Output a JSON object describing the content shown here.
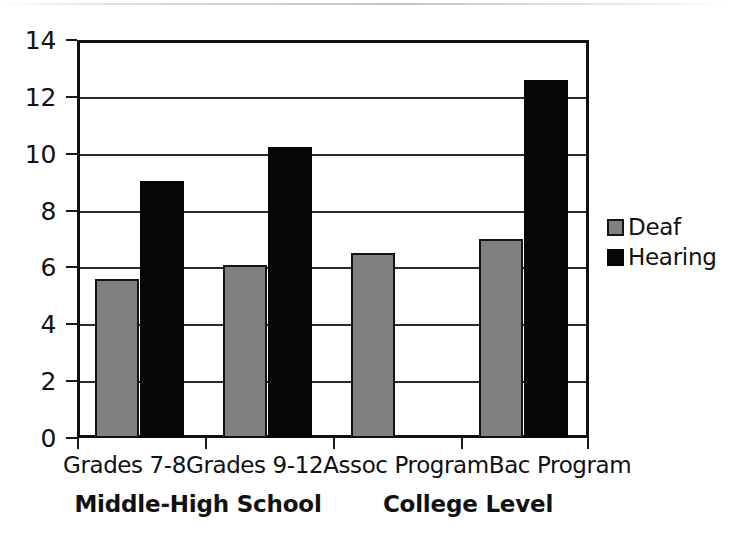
{
  "chart_data": {
    "type": "bar",
    "title": "",
    "subtitle": "",
    "xlabel": "",
    "ylabel": "",
    "categories": [
      "Grades 7-8",
      "Grades 9-12",
      "Assoc Program",
      "Bac Program"
    ],
    "group_labels": [
      "Middle-High School",
      "College Level"
    ],
    "series": [
      {
        "name": "Deaf",
        "color": "#808080",
        "values": [
          5.6,
          6.1,
          6.5,
          7.0
        ]
      },
      {
        "name": "Hearing",
        "color": "#060606",
        "values": [
          9.05,
          10.25,
          null,
          12.6
        ]
      }
    ],
    "ylim": [
      0,
      14
    ],
    "ytick_labels": [
      "0",
      "2",
      "4",
      "6",
      "8",
      "10",
      "12",
      "14"
    ],
    "ytick_values": [
      0,
      2,
      4,
      6,
      8,
      10,
      12,
      14
    ],
    "grid": true,
    "grid_axis": "y",
    "legend_position": "right",
    "legend_entries": [
      "Deaf",
      "Hearing"
    ]
  },
  "legend": {
    "items": [
      {
        "label": "Deaf",
        "swatch": "gray-square-icon"
      },
      {
        "label": "Hearing",
        "swatch": "black-square-icon"
      }
    ]
  }
}
